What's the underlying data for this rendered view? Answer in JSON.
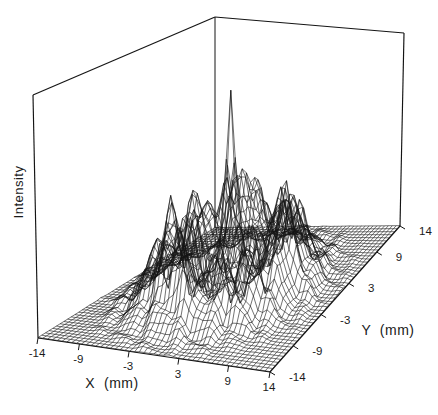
{
  "figure": {
    "width_px": 438,
    "height_px": 415,
    "background_color": "#ffffff",
    "ink_color": "#141414"
  },
  "chart_data": {
    "type": "surface",
    "plot_style": "3d-wireframe-mesh, hidden lines not removed, black ink on white",
    "title": "",
    "xlabel": "X  (mm)",
    "ylabel": "Y  (mm)",
    "zlabel": "Intensity",
    "x_range": [
      -14,
      14
    ],
    "y_range": [
      -14,
      14
    ],
    "z_range_relative": [
      0,
      1
    ],
    "x_ticks": [
      -14,
      -9,
      -3,
      3,
      9,
      14
    ],
    "y_ticks": [
      -14,
      -9,
      -3,
      3,
      9,
      14
    ],
    "grid_cells": 48,
    "surface_model": {
      "peak": {
        "amplitude": 0.84,
        "width_mm": 0.95,
        "shape_exponent": 1.5
      },
      "ring": {
        "amplitude": 0.27,
        "radius_mm": 6.3,
        "width_inner_mm": 1.7,
        "width_outer_mm": 3.0,
        "angular_modulation": [
          [
            3,
            0.22,
            1.3
          ],
          [
            7,
            0.16,
            0.4
          ],
          [
            12,
            0.11,
            2.1
          ]
        ]
      },
      "base": {
        "amplitude": 0.07,
        "width_mm": 7.5
      },
      "noise": {
        "base_amplitude": 0.02,
        "ring_amplitude": 0.05,
        "ring_width_mm": 2.5,
        "fade_radius_mm": 13,
        "terms": [
          [
            1.9,
            0.6,
            0.0,
            1.0
          ],
          [
            0.7,
            2.3,
            1.7,
            0.8
          ],
          [
            3.3,
            1.1,
            4.1,
            0.5
          ],
          [
            1.3,
            3.7,
            2.6,
            0.45
          ]
        ]
      }
    },
    "projection": {
      "floor_corners_screen": {
        "A_xmin_ymin": [
          38,
          338
        ],
        "B_xmax_ymin": [
          270,
          372
        ],
        "C_xmax_ymax": [
          400,
          226
        ],
        "D_xmin_ymax": [
          215,
          228
        ]
      },
      "wall_heights_px": {
        "A": 243,
        "B": 224,
        "C": 193,
        "D": 211
      },
      "wall_xshift_px": {
        "A": -5,
        "B": 1,
        "C": 4,
        "D": 0
      }
    },
    "labels_screen": {
      "xlabel_center": [
        112,
        383
      ],
      "ylabel_center": [
        388,
        330
      ],
      "zlabel_center": [
        18,
        192
      ]
    }
  }
}
